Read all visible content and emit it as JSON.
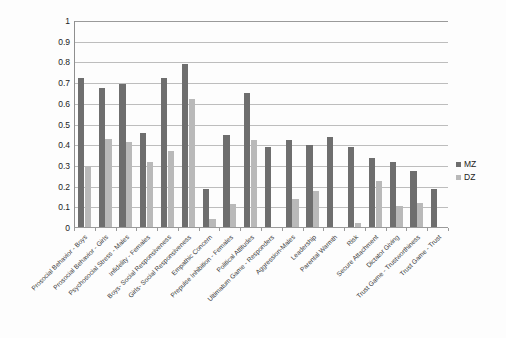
{
  "chart_data": {
    "type": "bar",
    "title": "",
    "subtitle": "",
    "xlabel": "",
    "ylabel": "",
    "ylim": [
      0,
      1
    ],
    "ytick_step": 0.1,
    "yticks": [
      "0",
      "0.1",
      "0.2",
      "0.3",
      "0.4",
      "0.5",
      "0.6",
      "0.7",
      "0.8",
      "0.9",
      "1"
    ],
    "grid": "horizontal",
    "legend_position": "right",
    "categories": [
      "Prosocial Behavior - Boys",
      "Prosocial Behavior - Girls",
      "Psychosocial Stress - Males",
      "Infidelity - Females",
      "Boys- Social Responsiveness",
      "Girls- Social Responsiveness",
      "Empathic Concern",
      "Prepulse Inhibition - Females",
      "Political Attitudes",
      "Ultimatum Game - Responders",
      "Aggression-Males",
      "Leadership",
      "Parental Warmth",
      "Risk",
      "Secure Attachment",
      "Dictator Giving",
      "Trust Game - Trustworthiness",
      "Trust Game - Trust"
    ],
    "series": [
      {
        "name": "MZ",
        "color": "#6e6e6e",
        "values": [
          0.725,
          0.675,
          0.695,
          0.46,
          0.725,
          0.79,
          0.19,
          0.45,
          0.65,
          0.39,
          0.425,
          0.4,
          0.44,
          0.393,
          0.34,
          0.32,
          0.275,
          0.19
        ]
      },
      {
        "name": "DZ",
        "color": "#b9b9b9",
        "values": [
          0.3,
          0.43,
          0.415,
          0.32,
          0.37,
          0.625,
          0.045,
          0.115,
          0.425,
          0.0,
          0.14,
          0.18,
          0.0,
          0.025,
          0.225,
          0.105,
          0.12,
          0.0
        ]
      }
    ]
  },
  "legend": {
    "entries": [
      {
        "label": "MZ",
        "marker": "legend-swatch-mz"
      },
      {
        "label": "DZ",
        "marker": "legend-swatch-dz"
      }
    ]
  },
  "colors": {
    "mz": "#6e6e6e",
    "dz": "#b9b9b9",
    "grid": "#bdbdbd",
    "axis": "#9a9a9a",
    "background": "#fdfdfd",
    "text": "#222222"
  }
}
